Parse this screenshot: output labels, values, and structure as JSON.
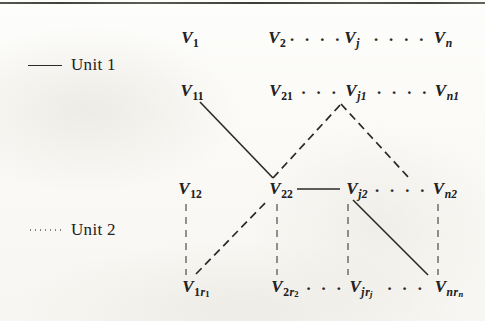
{
  "figure": {
    "type": "hierarchical-node-diagram",
    "background_color": "#fcfcfa",
    "ink_color": "#24221f",
    "top_rule": true
  },
  "legend": {
    "items": [
      {
        "label": "Unit 1",
        "line_style": "solid",
        "swatch_name": "solid-line-swatch"
      },
      {
        "label": "Unit 2",
        "line_style": "dotted",
        "swatch_name": "dotted-line-swatch"
      }
    ]
  },
  "rows": [
    {
      "name": "row-level-1",
      "nodes": [
        {
          "id": "V1",
          "base": "V",
          "sub": "1",
          "sub_italic": false,
          "x": 190,
          "y": 38
        },
        {
          "id": "V2",
          "base": "V",
          "sub": "2",
          "sub_italic": false,
          "x": 277,
          "y": 38
        },
        {
          "id": "Vj",
          "base": "V",
          "sub": "j",
          "sub_italic": true,
          "x": 352,
          "y": 38
        },
        {
          "id": "Vn",
          "base": "V",
          "sub": "n",
          "sub_italic": true,
          "x": 443,
          "y": 38
        }
      ],
      "ellipses": [
        {
          "dots": "· · · ·",
          "x": 316,
          "y": 40
        },
        {
          "dots": "· · · ·",
          "x": 400,
          "y": 40
        }
      ]
    },
    {
      "name": "row-level-2",
      "nodes": [
        {
          "id": "V11",
          "base": "V",
          "sub": "11",
          "sub_italic": false,
          "x": 192,
          "y": 91
        },
        {
          "id": "V21",
          "base": "V",
          "sub": "21",
          "sub_italic": false,
          "x": 281,
          "y": 91
        },
        {
          "id": "Vj1",
          "base": "V",
          "sub": "j1",
          "sub_italic": true,
          "x": 356,
          "y": 91
        },
        {
          "id": "Vn1",
          "base": "V",
          "sub": "n1",
          "sub_italic": true,
          "x": 447,
          "y": 91
        }
      ],
      "ellipses": [
        {
          "dots": "· · ·",
          "x": 320,
          "y": 93
        },
        {
          "dots": "· · · ·",
          "x": 403,
          "y": 93
        }
      ]
    },
    {
      "name": "row-level-3",
      "nodes": [
        {
          "id": "V12",
          "base": "V",
          "sub": "12",
          "sub_italic": false,
          "x": 190,
          "y": 189
        },
        {
          "id": "V22",
          "base": "V",
          "sub": "22",
          "sub_italic": false,
          "x": 281,
          "y": 189
        },
        {
          "id": "Vj2",
          "base": "V",
          "sub": "j2",
          "sub_italic": true,
          "x": 357,
          "y": 189
        },
        {
          "id": "Vn2",
          "base": "V",
          "sub": "n2",
          "sub_italic": true,
          "x": 445,
          "y": 189
        }
      ],
      "ellipses": [
        {
          "dots": "· · · ·",
          "x": 401,
          "y": 191
        }
      ]
    },
    {
      "name": "row-level-r",
      "nodes": [
        {
          "id": "V1r1",
          "base": "V",
          "sub": "1",
          "sub_italic": false,
          "sub_r": "r",
          "sub_r_index": "1",
          "x": 196,
          "y": 288
        },
        {
          "id": "V2r2",
          "base": "V",
          "sub": "2",
          "sub_italic": false,
          "sub_r": "r",
          "sub_r_index": "2",
          "x": 285,
          "y": 288
        },
        {
          "id": "Vjrj",
          "base": "V",
          "sub": "j",
          "sub_italic": true,
          "sub_r": "r",
          "sub_r_index": "j",
          "x": 361,
          "y": 288
        },
        {
          "id": "Vnrn",
          "base": "V",
          "sub": "n",
          "sub_italic": true,
          "sub_r": "r",
          "sub_r_index": "n",
          "x": 449,
          "y": 288
        }
      ],
      "ellipses": [
        {
          "dots": "· · ·",
          "x": 325,
          "y": 289
        },
        {
          "dots": "· · ·",
          "x": 406,
          "y": 289
        }
      ]
    }
  ],
  "vertical_dot_columns": [
    {
      "name": "vdots-col-1",
      "x": 186,
      "y": 201,
      "height": 74
    },
    {
      "name": "vdots-col-2",
      "x": 277,
      "y": 201,
      "height": 74
    },
    {
      "name": "vdots-col-j",
      "x": 348,
      "y": 201,
      "height": 74
    },
    {
      "name": "vdots-col-n",
      "x": 438,
      "y": 201,
      "height": 74
    }
  ],
  "connections": [
    {
      "name": "edge-V11-to-V22",
      "from": "V11",
      "to": "V22",
      "style": "solid",
      "unit": "Unit 1",
      "x1": 200,
      "y1": 102,
      "x2": 273,
      "y2": 178
    },
    {
      "name": "edge-V22-to-Vj1",
      "from": "V22",
      "to": "Vj1",
      "style": "dashed",
      "unit": "Unit 2",
      "x1": 273,
      "y1": 178,
      "x2": 341,
      "y2": 104
    },
    {
      "name": "edge-Vj1-to-Vn2",
      "from": "Vj1",
      "to": "Vn2",
      "style": "dashed",
      "unit": "Unit 2",
      "x1": 341,
      "y1": 104,
      "x2": 409,
      "y2": 178
    },
    {
      "name": "edge-V22-to-Vj2",
      "from": "V22",
      "to": "Vj2",
      "style": "solid",
      "unit": "Unit 1",
      "x1": 297,
      "y1": 189,
      "x2": 340,
      "y2": 189
    },
    {
      "name": "edge-V1r1-to-V22",
      "from": "V1r1",
      "to": "V22",
      "style": "dashed",
      "unit": "Unit 2",
      "x1": 196,
      "y1": 274,
      "x2": 268,
      "y2": 200
    },
    {
      "name": "edge-Vj2-to-Vnrn",
      "from": "Vj2",
      "to": "Vnrn",
      "style": "solid",
      "unit": "Unit 1",
      "x1": 353,
      "y1": 200,
      "x2": 428,
      "y2": 275
    }
  ]
}
